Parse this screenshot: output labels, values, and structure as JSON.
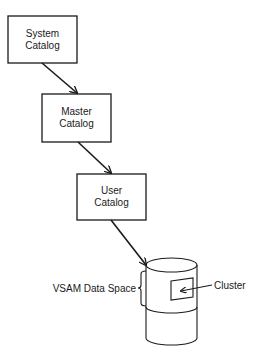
{
  "diagram": {
    "nodes": [
      {
        "id": "system",
        "line1": "System",
        "line2": "Catalog"
      },
      {
        "id": "master",
        "line1": "Master",
        "line2": "Catalog"
      },
      {
        "id": "user",
        "line1": "User",
        "line2": "Catalog"
      }
    ],
    "edges": [
      {
        "from": "system",
        "to": "master"
      },
      {
        "from": "master",
        "to": "user"
      },
      {
        "from": "user",
        "to": "volume"
      }
    ],
    "volume": {
      "data_space_label": "VSAM Data Space",
      "cluster_label": "Cluster"
    }
  }
}
